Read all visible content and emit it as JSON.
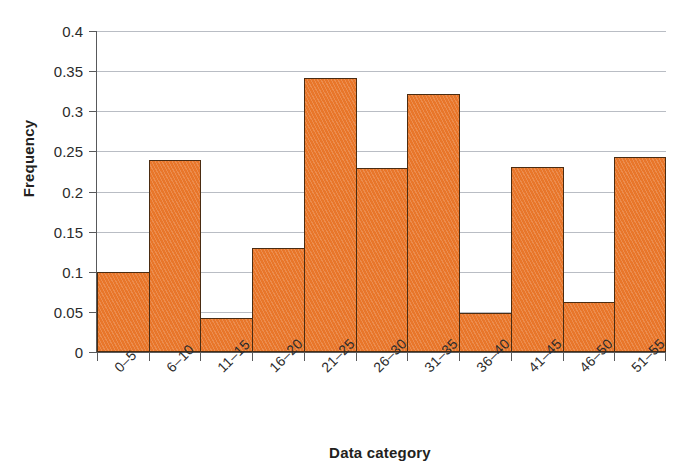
{
  "chart_data": {
    "type": "bar",
    "title": "",
    "xlabel": "Data category",
    "ylabel": "Frequency",
    "categories": [
      "0–5",
      "6–10",
      "11–15",
      "16–20",
      "21–25",
      "26–30",
      "31–35",
      "36–40",
      "41–45",
      "46–50",
      "51–55"
    ],
    "values": [
      0.1,
      0.239,
      0.042,
      0.13,
      0.342,
      0.229,
      0.322,
      0.049,
      0.231,
      0.062,
      0.243
    ],
    "ylim": [
      0,
      0.4
    ],
    "ytick_labels": [
      "0",
      "0.05",
      "0.1",
      "0.15",
      "0.2",
      "0.25",
      "0.3",
      "0.35",
      "0.4"
    ],
    "ytick_values": [
      0,
      0.05,
      0.1,
      0.15,
      0.2,
      0.25,
      0.3,
      0.35,
      0.4
    ],
    "grid": true,
    "legend": false,
    "bar_color": "#e8762a",
    "bar_border_color": "#4a2c12",
    "gridline_color": "#b9bdc4",
    "axis_color": "#58595b",
    "xtick_rotation": -45,
    "bars_touching": true
  },
  "axes": {
    "y_title": "Frequency",
    "x_title": "Data category"
  }
}
